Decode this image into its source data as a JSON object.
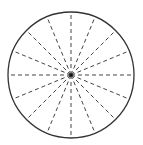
{
  "diagram": {
    "type": "circle-with-radial-spokes",
    "width": 143,
    "height": 145,
    "circle": {
      "cx": 71,
      "cy": 75,
      "r": 63,
      "stroke": "#333333",
      "stroke_width": 1.3
    },
    "spokes": {
      "count": 16,
      "angle_step_deg": 22.5,
      "stroke": "#444444",
      "stroke_width": 1,
      "dash": "4 3"
    },
    "center_dot": {
      "r": 1.6,
      "fill": "#111111"
    }
  }
}
